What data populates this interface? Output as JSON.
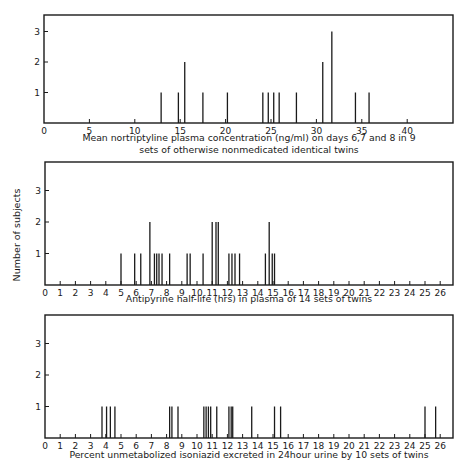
{
  "y_axis_label": "Number of subjects",
  "chart_data": [
    {
      "type": "bar",
      "title": "",
      "xlabel": "Mean nortriptyline plasma concentration (ng/ml) on days 6,7 and 8 in 9 sets of otherwise nonmedicated identical twins",
      "xlabel_lines": [
        "Mean nortriptyline plasma concentration (ng/ml) on days 6,7 and 8 in 9",
        "sets of otherwise nonmedicated identical twins"
      ],
      "ylabel": "Number of subjects",
      "xlim": [
        0,
        45
      ],
      "ylim": [
        0,
        3.5
      ],
      "x_ticks": [
        0,
        5,
        10,
        15,
        20,
        25,
        30,
        35,
        40
      ],
      "y_ticks": [
        1,
        2,
        3
      ],
      "grid": false,
      "x": [
        12.9,
        14.8,
        15.5,
        17.5,
        20.2,
        24.1,
        24.7,
        25.3,
        25.9,
        27.8,
        30.7,
        31.7,
        34.3,
        35.8
      ],
      "values": [
        1,
        1,
        2,
        1,
        1,
        1,
        1,
        1,
        1,
        1,
        2,
        3,
        1,
        1
      ]
    },
    {
      "type": "bar",
      "title": "",
      "xlabel": "Antipyrine half-life (hrs) in plasma of 14 sets of twins",
      "xlabel_lines": [
        "Antipyrine half-life (hrs) in plasma of 14 sets of twins"
      ],
      "ylabel": "Number of subjects",
      "xlim": [
        0,
        27
      ],
      "ylim": [
        0,
        3.8
      ],
      "x_ticks": [
        0,
        1,
        2,
        3,
        4,
        5,
        6,
        7,
        8,
        9,
        10,
        11,
        12,
        13,
        14,
        15,
        16,
        17,
        18,
        19,
        20,
        21,
        22,
        23,
        24,
        25,
        26
      ],
      "y_ticks": [
        1,
        2,
        3
      ],
      "grid": false,
      "x": [
        5.0,
        5.9,
        6.3,
        6.9,
        7.2,
        7.35,
        7.5,
        7.7,
        8.2,
        9.35,
        9.55,
        10.4,
        11.0,
        11.25,
        11.4,
        12.1,
        12.3,
        12.5,
        12.8,
        14.5,
        14.75,
        14.95,
        15.1
      ],
      "values": [
        1,
        1,
        1,
        2,
        1,
        1,
        1,
        1,
        1,
        1,
        1,
        1,
        2,
        2,
        2,
        1,
        1,
        1,
        1,
        1,
        2,
        1,
        1
      ]
    },
    {
      "type": "bar",
      "title": "",
      "xlabel": "Percent unmetabolized isoniazid excreted in 24hour urine by 10 sets of twins",
      "xlabel_lines": [
        "Percent unmetabolized isoniazid excreted in 24hour urine by 10 sets of twins"
      ],
      "ylabel": "Number of subjects",
      "xlim": [
        0,
        27
      ],
      "ylim": [
        0,
        3.8
      ],
      "x_ticks": [
        0,
        1,
        2,
        3,
        4,
        5,
        6,
        7,
        8,
        9,
        10,
        11,
        12,
        13,
        14,
        15,
        16,
        17,
        18,
        19,
        20,
        21,
        22,
        23,
        24,
        25,
        26
      ],
      "y_ticks": [
        1,
        2,
        3
      ],
      "grid": false,
      "x": [
        3.75,
        4.05,
        4.3,
        4.6,
        8.2,
        8.35,
        8.75,
        10.45,
        10.6,
        10.75,
        10.9,
        11.3,
        12.1,
        12.25,
        12.35,
        13.6,
        15.1,
        15.5,
        25.0,
        25.7
      ],
      "values": [
        1,
        1,
        1,
        1,
        1,
        1,
        1,
        1,
        1,
        1,
        1,
        1,
        1,
        1,
        1,
        1,
        1,
        1,
        1,
        1
      ]
    }
  ]
}
